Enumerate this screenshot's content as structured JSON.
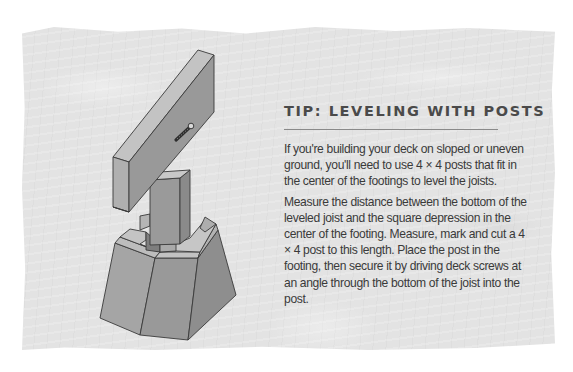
{
  "tip": {
    "title": "TIP: LEVELING WITH POSTS",
    "paragraphs": [
      "If you're building your deck on sloped or uneven ground, you'll need to use 4 × 4 posts that fit in the center of the footings to level the joists.",
      "Measure the distance between the bottom of the leveled joist and the square depression in the center of the footing. Measure, mark and cut a 4 × 4 post to this length. Place the post in the footing, then secure it by driving deck screws at an angle through the bottom of the joist into the post."
    ]
  },
  "illustration": {
    "subject": "joist resting on 4x4 post set in a concrete footing, fastened with deck screw",
    "colors": {
      "face_light": "#b9b9b9",
      "face_mid": "#9a9a9a",
      "face_dark": "#8c8c8c",
      "outline": "#3a3a3a",
      "panel_bg": "#e3e3e3"
    }
  }
}
